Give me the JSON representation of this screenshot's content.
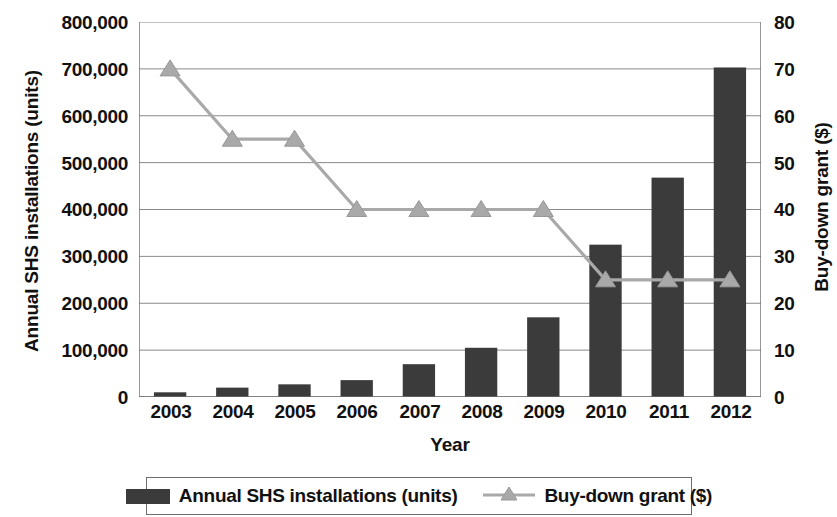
{
  "chart_data": {
    "type": "bar",
    "title": "",
    "subtitle": "",
    "xlabel": "Year",
    "categories": [
      "2003",
      "2004",
      "2005",
      "2006",
      "2007",
      "2008",
      "2009",
      "2010",
      "2011",
      "2012"
    ],
    "grid": true,
    "legend_position": "bottom",
    "axes": {
      "left": {
        "label": "Annual SHS installations (units)",
        "ylim": [
          0,
          800000
        ],
        "tick_step": 100000,
        "ticks": [
          "0",
          "100,000",
          "200,000",
          "300,000",
          "400,000",
          "500,000",
          "600,000",
          "700,000",
          "800,000"
        ],
        "tick_values": [
          0,
          100000,
          200000,
          300000,
          400000,
          500000,
          600000,
          700000,
          800000
        ]
      },
      "right": {
        "label": "Buy-down grant ($)",
        "ylim": [
          0,
          80
        ],
        "tick_step": 10,
        "ticks": [
          "0",
          "10",
          "20",
          "30",
          "40",
          "50",
          "60",
          "70",
          "80"
        ],
        "tick_values": [
          0,
          10,
          20,
          30,
          40,
          50,
          60,
          70,
          80
        ]
      }
    },
    "series": [
      {
        "name": "Annual SHS installations (units)",
        "type": "bar",
        "axis": "left",
        "color": "#3b3b3b",
        "values": [
          10000,
          20000,
          27000,
          36000,
          70000,
          105000,
          170000,
          325000,
          468000,
          703000
        ]
      },
      {
        "name": "Buy-down grant ($)",
        "type": "line",
        "axis": "right",
        "color": "#a9a9a9",
        "marker": "triangle",
        "values": [
          70,
          55,
          55,
          40,
          40,
          40,
          40,
          25,
          25,
          25
        ]
      }
    ]
  },
  "legend": {
    "items": [
      {
        "label": "Annual SHS installations (units)",
        "marker": "bar-swatch",
        "color": "#3b3b3b"
      },
      {
        "label": "Buy-down grant ($)",
        "marker": "line-triangle",
        "color": "#a9a9a9"
      }
    ]
  },
  "colors": {
    "bar": "#3b3b3b",
    "line": "#a9a9a9",
    "grid": "#8a8a8a",
    "axis": "#6d6d6d",
    "text": "#111111",
    "background": "#ffffff"
  }
}
